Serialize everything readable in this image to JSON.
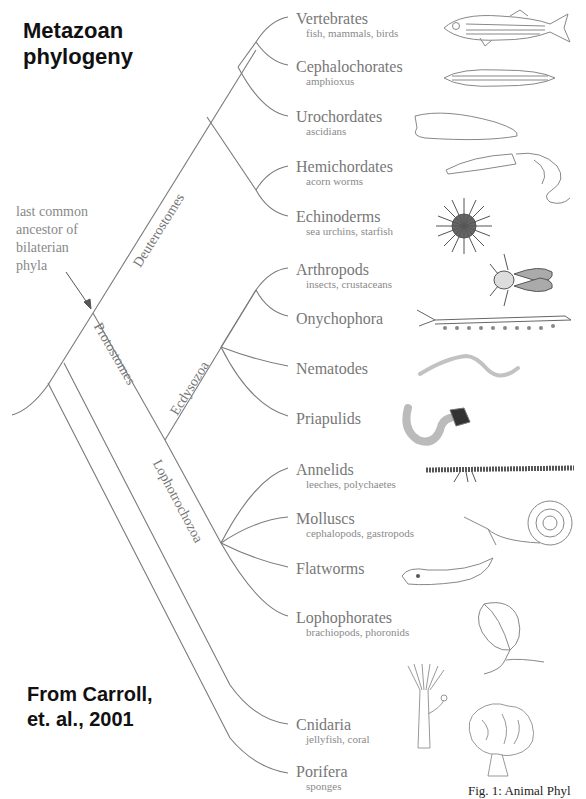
{
  "title": "Metazoan\nphylogeny",
  "title_lines": [
    "Metazoan",
    "phylogeny"
  ],
  "source_lines": [
    "From Carroll,",
    "et. al., 2001"
  ],
  "caption": "Fig. 1: Animal Phyl",
  "ancestor_note_lines": [
    "last common",
    "ancestor of",
    "bilaterian",
    "phyla"
  ],
  "clades": {
    "deuterostomes": "Deuterostomes",
    "protostomes": "Protostomes",
    "ecdysozoa": "Ecdysozoa",
    "lophotrochozoa": "Lophotrochozoa"
  },
  "taxa": [
    {
      "name": "Vertebrates",
      "sub": "fish, mammals, birds",
      "icon": "fish-icon"
    },
    {
      "name": "Cephalochorates",
      "sub": "amphioxus",
      "icon": "lancelet-icon"
    },
    {
      "name": "Urochordates",
      "sub": "ascidians",
      "icon": "tunicate-icon"
    },
    {
      "name": "Hemichordates",
      "sub": "acorn worms",
      "icon": "acorn-worm-icon"
    },
    {
      "name": "Echinoderms",
      "sub": "sea urchins, starfish",
      "icon": "sea-urchin-icon"
    },
    {
      "name": "Arthropods",
      "sub": "insects, crustaceans",
      "icon": "fly-icon"
    },
    {
      "name": "Onychophora",
      "sub": "",
      "icon": "velvet-worm-icon"
    },
    {
      "name": "Nematodes",
      "sub": "",
      "icon": "roundworm-icon"
    },
    {
      "name": "Priapulids",
      "sub": "",
      "icon": "priapulid-icon"
    },
    {
      "name": "Annelids",
      "sub": "leeches, polychaetes",
      "icon": "polychaete-icon"
    },
    {
      "name": "Molluscs",
      "sub": "cephalopods, gastropods",
      "icon": "snail-icon"
    },
    {
      "name": "Flatworms",
      "sub": "",
      "icon": "flatworm-icon"
    },
    {
      "name": "Lophophorates",
      "sub": "brachiopods, phoronids",
      "icon": "brachiopod-icon"
    },
    {
      "name": "Cnidaria",
      "sub": "jellyfish, coral",
      "icon": "hydra-icon"
    },
    {
      "name": "Porifera",
      "sub": "sponges",
      "icon": "sponge-icon"
    }
  ],
  "colors": {
    "line": "#777777",
    "text": "#777777",
    "title": "#111111"
  }
}
